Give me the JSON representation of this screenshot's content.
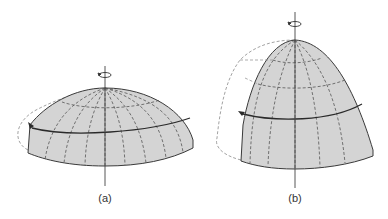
{
  "figure": {
    "panels": [
      {
        "id": "a",
        "label": "(a)",
        "description": "oblate rotating dome (flattened)"
      },
      {
        "id": "b",
        "label": "(b)",
        "description": "prolate rotating dome (elongated)"
      }
    ]
  },
  "colors": {
    "fill": "#d4d4d4",
    "outline": "#3a3a3a",
    "dashed": "#555555",
    "ghost": "#8a8a8a",
    "axis": "#444444",
    "background": "#ffffff"
  }
}
